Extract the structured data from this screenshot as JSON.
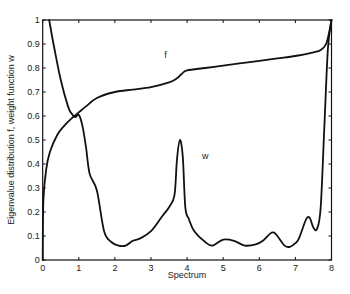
{
  "chart_data": {
    "type": "line",
    "title": "",
    "xlabel": "Spectrum",
    "ylabel": "Eigenvalue distribution f, weight function w",
    "xlim": [
      0,
      8
    ],
    "ylim": [
      0,
      1
    ],
    "xticks": [
      0,
      1,
      2,
      3,
      4,
      5,
      6,
      7,
      8
    ],
    "yticks": [
      0,
      0.1,
      0.2,
      0.3,
      0.4,
      0.5,
      0.6,
      0.7,
      0.8,
      0.9,
      1
    ],
    "ytick_labels": [
      "0",
      "0.1",
      "0.2",
      "0.3",
      "0.4",
      "0.5",
      "0.6",
      "0.7",
      "0.8",
      "0.9",
      "1"
    ],
    "grid": false,
    "legend": null,
    "annotations": [
      {
        "text": "f",
        "x": 3.4,
        "y": 0.84
      },
      {
        "text": "w",
        "x": 4.5,
        "y": 0.42
      }
    ],
    "series": [
      {
        "name": "f",
        "x": [
          0.0,
          0.02,
          0.1,
          0.2,
          0.4,
          0.6,
          0.8,
          1.0,
          1.2,
          1.5,
          2.0,
          2.5,
          3.0,
          3.5,
          3.7,
          3.85,
          4.0,
          4.5,
          5.0,
          5.5,
          6.0,
          6.5,
          7.0,
          7.5,
          7.7,
          7.85,
          7.95,
          8.0
        ],
        "y": [
          0.0,
          0.25,
          0.38,
          0.45,
          0.52,
          0.56,
          0.59,
          0.615,
          0.64,
          0.675,
          0.7,
          0.71,
          0.72,
          0.74,
          0.755,
          0.775,
          0.79,
          0.8,
          0.81,
          0.82,
          0.83,
          0.84,
          0.85,
          0.865,
          0.875,
          0.9,
          0.96,
          1.0
        ]
      },
      {
        "name": "w",
        "x": [
          0.18,
          0.3,
          0.5,
          0.7,
          0.8,
          0.9,
          1.0,
          1.1,
          1.2,
          1.3,
          1.5,
          1.7,
          1.9,
          2.1,
          2.3,
          2.5,
          2.7,
          3.0,
          3.3,
          3.5,
          3.65,
          3.72,
          3.8,
          3.88,
          3.95,
          4.05,
          4.2,
          4.5,
          4.7,
          5.0,
          5.3,
          5.6,
          5.9,
          6.1,
          6.3,
          6.4,
          6.5,
          6.7,
          6.85,
          7.0,
          7.1,
          7.3,
          7.4,
          7.5,
          7.6,
          7.7,
          7.8,
          7.9,
          8.0
        ],
        "y": [
          1.0,
          0.9,
          0.75,
          0.64,
          0.61,
          0.595,
          0.605,
          0.56,
          0.47,
          0.36,
          0.29,
          0.12,
          0.075,
          0.06,
          0.06,
          0.08,
          0.09,
          0.12,
          0.18,
          0.22,
          0.27,
          0.42,
          0.5,
          0.43,
          0.22,
          0.17,
          0.12,
          0.075,
          0.06,
          0.085,
          0.08,
          0.06,
          0.065,
          0.08,
          0.11,
          0.115,
          0.1,
          0.06,
          0.055,
          0.07,
          0.09,
          0.17,
          0.175,
          0.135,
          0.13,
          0.22,
          0.55,
          0.88,
          1.0
        ]
      }
    ]
  }
}
